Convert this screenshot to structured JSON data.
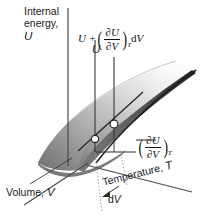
{
  "figure": {
    "title_axes": {
      "u_axis_line1": "Internal",
      "u_axis_line2": "energy,",
      "u_axis_symbol": "U",
      "v_axis_text": "Volume,",
      "v_axis_symbol": "V",
      "t_axis_text": "Temperature,",
      "t_axis_symbol": "T"
    },
    "annotations": {
      "u_value_label": "U",
      "dv_label_prefix": "d",
      "dv_label_symbol": "V",
      "top_formula": {
        "lead": "U +",
        "numerator": "∂U",
        "denominator": "∂V",
        "subscript": "T",
        "trailing_d": "d",
        "trailing_var": "V",
        "plain": "U + (∂U/∂V)_T dV"
      },
      "slope_formula": {
        "numerator": "∂U",
        "denominator": "∂V",
        "subscript": "T",
        "plain": "(∂U/∂V)_T"
      }
    },
    "colors": {
      "background": "#ffffff",
      "surface_light": "#f2f2f2",
      "surface_mid": "#9a9a9a",
      "surface_dark": "#3a3a3a",
      "underside": "#555555",
      "axis": "#3d3d3d",
      "text": "#1a1a1a",
      "marker_fill": "#ffffff",
      "marker_stroke": "#222222"
    },
    "markers": [
      {
        "name": "point-u",
        "x": 95,
        "y": 139
      },
      {
        "name": "point-u-plus-du",
        "x": 114,
        "y": 124
      }
    ]
  }
}
